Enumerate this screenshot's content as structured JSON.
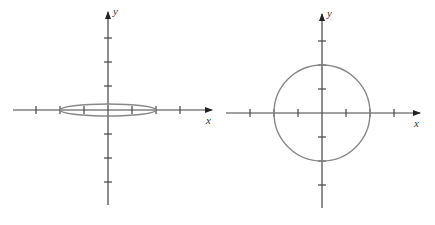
{
  "diagrams": [
    {
      "name": "ellipse-plot",
      "origin_px": [
        108,
        110
      ],
      "unit_px": 24,
      "x_axis": {
        "label": "x",
        "from_px": 13,
        "to_px": 212,
        "ticks": [
          -3,
          -2,
          -1,
          1,
          2,
          3
        ]
      },
      "y_axis": {
        "label": "y",
        "from_px": 205,
        "to_px": 12,
        "ticks": [
          -3,
          -2,
          -1,
          1,
          2,
          3
        ]
      },
      "shape": {
        "type": "ellipse",
        "semi_major_x": 2,
        "semi_minor_y": 0.25,
        "color": "#888888"
      }
    },
    {
      "name": "circle-plot",
      "origin_px": [
        322,
        113
      ],
      "unit_px": 24,
      "x_axis": {
        "label": "x",
        "from_px": 226,
        "to_px": 420,
        "ticks": [
          -3,
          -2,
          -1,
          1,
          2,
          3
        ]
      },
      "y_axis": {
        "label": "y",
        "from_px": 208,
        "to_px": 14,
        "ticks": [
          -3,
          -2,
          -1,
          1,
          2,
          3
        ]
      },
      "shape": {
        "type": "circle",
        "radius": 2,
        "color": "#888888"
      }
    }
  ]
}
